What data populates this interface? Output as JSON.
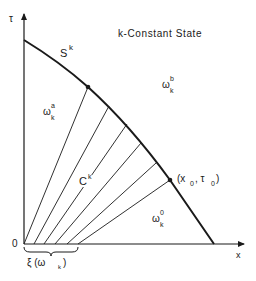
{
  "diagram": {
    "title": "k-Constant State",
    "axes": {
      "vertical_label": "τ",
      "horizontal_label": "x",
      "origin_label": "0"
    },
    "curve_label": "S",
    "curve_label_sup": "k",
    "region_a": {
      "base": "ω",
      "sub": "k",
      "sup": "a"
    },
    "region_b": {
      "base": "ω",
      "sub": "k",
      "sup": "b"
    },
    "region_0": {
      "base": "ω",
      "sub": "k",
      "sup": "0"
    },
    "fan_label": "C",
    "fan_label_sup": "k",
    "point_label": "(x",
    "point_sub1": "0",
    "point_mid": ", τ",
    "point_sub2": "0",
    "point_close": ")",
    "brace_label": "ξ (ω",
    "brace_sub": "k",
    "brace_close": ")",
    "colors": {
      "ink": "#1a1a1a",
      "background": "#ffffff"
    }
  }
}
